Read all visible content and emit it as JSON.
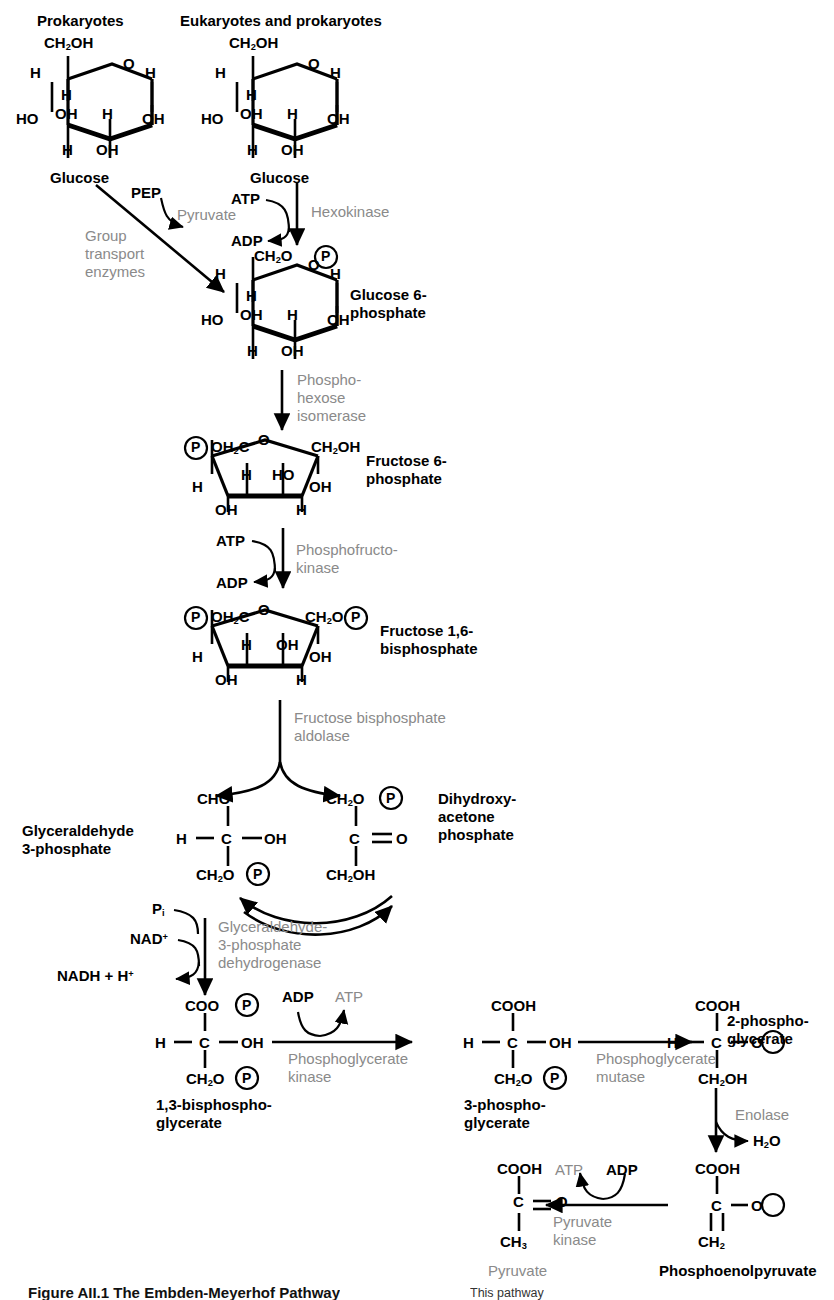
{
  "figure": {
    "domain": "textbook-diagram",
    "caption_prefix": "Figure AII.1",
    "caption_text": "The Embden-Meyerhof Pathway",
    "caption_right": "This pathway",
    "ink_color": "#000000",
    "enzyme_color": "#8a8a8a"
  },
  "headers": {
    "left": "Prokaryotes",
    "right": "Eukaryotes and prokaryotes"
  },
  "metabolites": {
    "glucose_left": "Glucose",
    "glucose_right": "Glucose",
    "g6p_line1": "Glucose 6-",
    "g6p_line2": "phosphate",
    "f6p_line1": "Fructose 6-",
    "f6p_line2": "phosphate",
    "fbp_line1": "Fructose 1,6-",
    "fbp_line2": "bisphosphate",
    "g3p_line1": "Glyceraldehyde",
    "g3p_line2": "3-phosphate",
    "dhap_line1": "Dihydroxy-",
    "dhap_line2": "acetone",
    "dhap_line3": "phosphate",
    "bpg_line1": "1,3-bisphospho-",
    "bpg_line2": "glycerate",
    "pg3_line1": "3-phospho-",
    "pg3_line2": "glycerate",
    "pg2_line1": "2-phospho-",
    "pg2_line2": "glycerate",
    "pep": "Phosphoenolpyruvate",
    "pyruvate_final": "Pyruvate"
  },
  "enzymes": {
    "group_transport_l1": "Group",
    "group_transport_l2": "transport",
    "group_transport_l3": "enzymes",
    "hexokinase": "Hexokinase",
    "phosphohexose_l1": "Phospho-",
    "phosphohexose_l2": "hexose",
    "phosphohexose_l3": "isomerase",
    "pfk_l1": "Phosphofructo-",
    "pfk_l2": "kinase",
    "aldolase_l1": "Fructose bisphosphate",
    "aldolase_l2": "aldolase",
    "gapdh_l1": "Glyceraldehyde-",
    "gapdh_l2": "3-phosphate",
    "gapdh_l3": "dehydrogenase",
    "pgk_l1": "Phosphoglycerate",
    "pgk_l2": "kinase",
    "pgm_l1": "Phosphoglycerate",
    "pgm_l2": "mutase",
    "enolase": "Enolase",
    "pyruvate_kinase_l1": "Pyruvate",
    "pyruvate_kinase_l2": "kinase"
  },
  "cofactors": {
    "pep": "PEP",
    "pyruvate": "Pyruvate",
    "atp_1": "ATP",
    "adp_1": "ADP",
    "atp_2": "ATP",
    "adp_2": "ADP",
    "pi": "P",
    "pi_sub": "i",
    "nad": "NAD",
    "nad_sup": "+",
    "nadh": "NADH + H",
    "nadh_sup": "+",
    "adp_3": "ADP",
    "atp_3": "ATP",
    "water_main": "H",
    "water_sub": "2",
    "water_tail": "O",
    "atp_4": "ATP",
    "adp_4": "ADP"
  },
  "atoms": {
    "ch2oh": "CH",
    "ch2oh_sub": "2",
    "ch2oh_tail": "OH",
    "ch2o": "CH",
    "ch2o_sub": "2",
    "ch2o_tail": "O",
    "oh2c_head": "OH",
    "oh2c_sub": "2",
    "oh2c_tail": "C",
    "H": "H",
    "O": "O",
    "OH": "OH",
    "HO": "HO",
    "P": "P",
    "C": "C",
    "CHO": "CHO",
    "COOH": "COOH",
    "COO": "COO",
    "CH3": "CH",
    "ch3_sub": "3",
    "CH2": "CH",
    "ch2_sub": "2",
    "eq": "=",
    "dash": "—"
  },
  "rings": {
    "glucose_left": {
      "top": "CH2OH",
      "ring_o": "O",
      "left_h": "H",
      "inner_h_left": "H",
      "right_h": "H",
      "ho": "HO",
      "inner_oh": "OH",
      "inner_h_right": "H",
      "right_oh": "OH",
      "bottom_h": "H",
      "bottom_oh": "OH"
    },
    "glucose_right": {
      "top": "CH2OH",
      "ring_o": "O",
      "left_h": "H",
      "inner_h_left": "H",
      "right_h": "H",
      "ho": "HO",
      "inner_oh": "OH",
      "inner_h_right": "H",
      "right_oh": "OH",
      "bottom_h": "H",
      "bottom_oh": "OH"
    },
    "g6p": {
      "top": "CH2O-P",
      "ring_o": "O",
      "left_h": "H",
      "inner_h_left": "H",
      "right_h": "H",
      "ho": "HO",
      "inner_oh": "OH",
      "inner_h_right": "H",
      "right_oh": "OH",
      "bottom_h": "H",
      "bottom_oh": "OH"
    },
    "f6p": {
      "left_top": "P-OH2C",
      "ring_o": "O",
      "right_top": "CH2OH",
      "left_h": "H",
      "inner_h": "H",
      "inner_ho": "HO",
      "right_oh": "OH",
      "bottom_oh": "OH",
      "bottom_h": "H"
    },
    "fbp": {
      "left_top": "P-OH2C",
      "ring_o": "O",
      "right_top": "CH2O-P",
      "left_h": "H",
      "inner_h": "H",
      "inner_oh": "OH",
      "right_oh": "OH",
      "bottom_oh": "OH",
      "bottom_h": "H"
    }
  },
  "chains": {
    "g3p": {
      "c1": "CHO",
      "c2_left": "H",
      "c2": "C",
      "c2_right": "OH",
      "c3": "CH2O-P"
    },
    "dhap": {
      "c1": "CH2O-P",
      "c2": "C",
      "c2_right": "O",
      "c3": "CH2OH"
    },
    "bpg": {
      "c1": "COO-P",
      "c2_left": "H",
      "c2": "C",
      "c2_right": "OH",
      "c3": "CH2O-P"
    },
    "pg3": {
      "c1": "COOH",
      "c2_left": "H",
      "c2": "C",
      "c2_right": "OH",
      "c3": "CH2O-P"
    },
    "pg2": {
      "c1": "COOH",
      "c2_left": "H",
      "c2": "C",
      "c2_right": "O-P",
      "c3": "CH2OH"
    },
    "pep": {
      "c1": "COOH",
      "c2": "C",
      "c2_right": "O-P",
      "c3": "CH2"
    },
    "pyr": {
      "c1": "COOH",
      "c2": "C",
      "c2_right": "O",
      "c3": "CH3"
    }
  }
}
